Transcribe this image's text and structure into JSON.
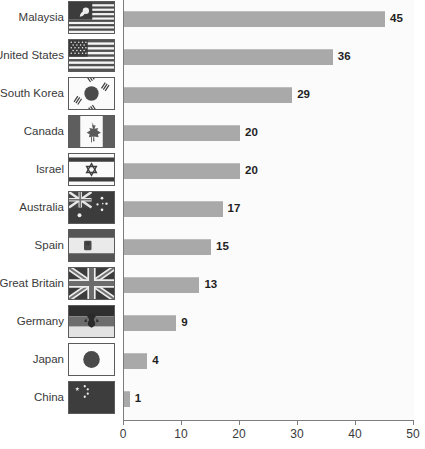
{
  "chart_data": {
    "type": "bar",
    "orientation": "horizontal",
    "title": "",
    "subtitle": "",
    "xlabel": "",
    "ylabel": "",
    "xlim": [
      0,
      50
    ],
    "x_ticks": [
      0,
      10,
      20,
      30,
      40,
      50
    ],
    "x_tick_labels": [
      "0",
      "10",
      "20",
      "30",
      "40",
      "50"
    ],
    "grid": false,
    "legend": "none",
    "bar_color": "#a9a9a9",
    "axis_color": "#7d7d7d",
    "label_color": "#3a3a3a",
    "value_label_color": "#1f1f1f",
    "categories": [
      "Malaysia",
      "United States",
      "South Korea",
      "Canada",
      "Israel",
      "Australia",
      "Spain",
      "Great Britain",
      "Germany",
      "Japan",
      "China"
    ],
    "values": [
      45,
      36,
      29,
      20,
      20,
      17,
      15,
      13,
      9,
      4,
      1
    ],
    "value_labels": [
      "45",
      "36",
      "29",
      "20",
      "20",
      "17",
      "15",
      "13",
      "9",
      "4",
      "1"
    ],
    "flags": [
      "flag-malaysia-icon",
      "flag-united-states-icon",
      "flag-south-korea-icon",
      "flag-canada-icon",
      "flag-israel-icon",
      "flag-australia-icon",
      "flag-spain-icon",
      "flag-great-britain-icon",
      "flag-germany-icon",
      "flag-japan-icon",
      "flag-china-icon"
    ]
  }
}
